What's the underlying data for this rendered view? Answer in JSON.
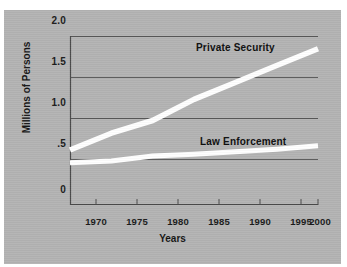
{
  "chart_data": {
    "type": "line",
    "title": "",
    "xlabel": "Years",
    "ylabel": "Millions of Persons",
    "xlim": [
      1970,
      2000
    ],
    "ylim": [
      0,
      2.0
    ],
    "yticks": [
      "0",
      ".5",
      "1.0",
      "1.5",
      "2.0"
    ],
    "ytick_values": [
      0,
      0.5,
      1.0,
      1.5,
      2.0
    ],
    "xticks": [
      "1970",
      "1975",
      "1980",
      "1985",
      "1990",
      "1995",
      "2000"
    ],
    "xtick_values": [
      1970,
      1975,
      1980,
      1985,
      1990,
      1995,
      2000
    ],
    "grid": true,
    "legend_position": "inline-annotation",
    "x": [
      1970,
      1975,
      1980,
      1985,
      1990,
      1995,
      2000
    ],
    "series": [
      {
        "name": "Private Security",
        "color": "#ffffff",
        "values": [
          0.65,
          0.85,
          1.0,
          1.25,
          1.45,
          1.65,
          1.85
        ]
      },
      {
        "name": "Law Enforcement",
        "color": "#ffffff",
        "values": [
          0.5,
          0.52,
          0.58,
          0.6,
          0.63,
          0.66,
          0.7
        ]
      }
    ]
  },
  "colors": {
    "card_background": "#b3b3b3",
    "page_background": "#ffffff",
    "axis": "#4a4a4a",
    "grid": "#5a5a5a",
    "line": "#ffffff",
    "text": "#151515"
  }
}
